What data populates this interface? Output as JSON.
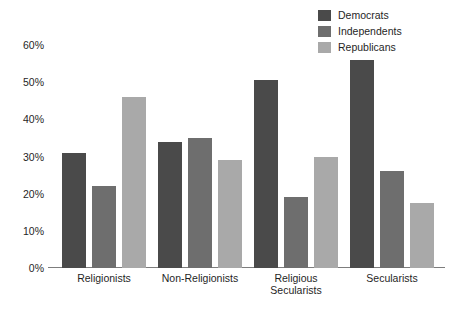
{
  "chart_data": {
    "type": "bar",
    "title": "",
    "subtitle": "",
    "xlabel": "",
    "ylabel": "",
    "ylim": [
      0,
      60
    ],
    "yticks": [
      0,
      10,
      20,
      30,
      40,
      50,
      60
    ],
    "ytick_labels": [
      "0%",
      "10%",
      "20%",
      "30%",
      "40%",
      "50%",
      "60%"
    ],
    "grid": false,
    "legend_position": "top-right",
    "categories": [
      "Religionists",
      "Non-Religionists",
      "Religious\nSecularists",
      "Secularists"
    ],
    "series": [
      {
        "name": "Democrats",
        "color": "#4a4a4a",
        "values": [
          31,
          34,
          50.5,
          56
        ]
      },
      {
        "name": "Independents",
        "color": "#6e6e6e",
        "values": [
          22,
          35,
          19,
          26
        ]
      },
      {
        "name": "Republicans",
        "color": "#a9a9a9",
        "values": [
          46,
          29,
          30,
          17.5
        ]
      }
    ]
  },
  "legend": {
    "items": [
      {
        "label": "Democrats",
        "color": "#4a4a4a"
      },
      {
        "label": "Independents",
        "color": "#6e6e6e"
      },
      {
        "label": "Republicans",
        "color": "#a9a9a9"
      }
    ]
  },
  "axis": {
    "y_labels": [
      "60%",
      "50%",
      "40%",
      "30%",
      "20%",
      "10%",
      "0%"
    ],
    "x_labels": [
      "Religionists",
      "Non-Religionists",
      "Religious\nSecularists",
      "Secularists"
    ]
  }
}
